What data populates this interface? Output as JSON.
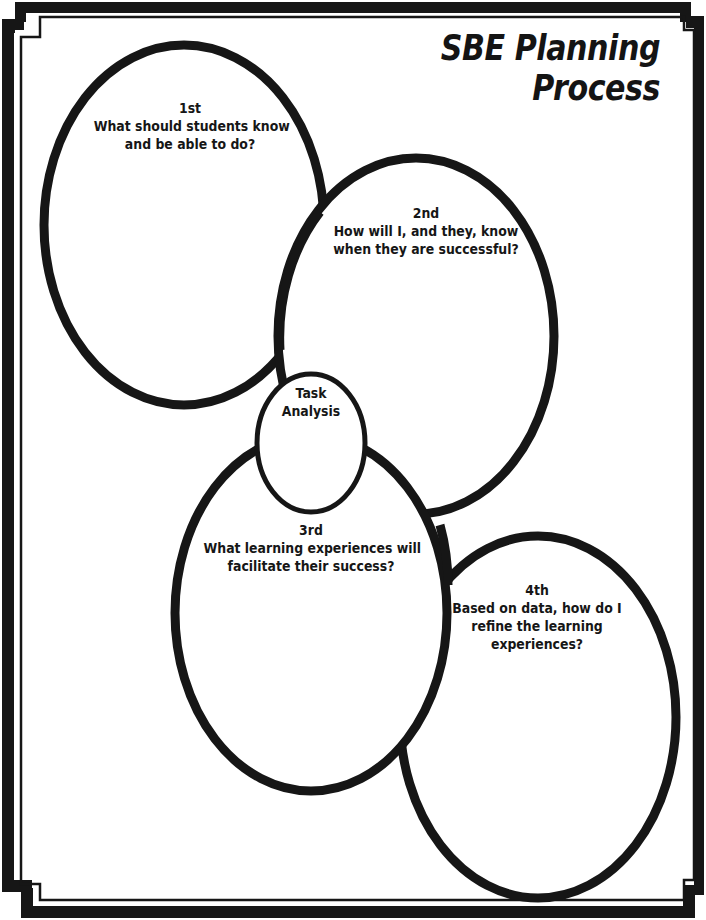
{
  "title": {
    "line1": "SBE Planning",
    "line2": "Process"
  },
  "colors": {
    "ink": "#161616",
    "paper": "#ffffff"
  },
  "steps": [
    {
      "order": "1st",
      "lines": [
        "What should students know",
        "and be able to do?"
      ]
    },
    {
      "order": "2nd",
      "lines": [
        "How will I, and they, know",
        "when they are successful?"
      ]
    },
    {
      "order": "3rd",
      "lines": [
        "What learning experiences will",
        "facilitate their success?"
      ]
    },
    {
      "order": "4th",
      "lines": [
        "Based on data, how do I",
        "refine the learning",
        "experiences?"
      ]
    }
  ],
  "task_analysis": {
    "lines": [
      "Task",
      "Analysis"
    ]
  }
}
